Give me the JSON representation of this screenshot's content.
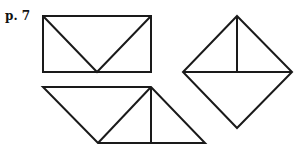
{
  "page_label": "p. 7",
  "stroke_color": "#1a1a1a",
  "figures": [
    {
      "name": "rectangle-with-v",
      "description": "Rectangle with two diagonals meeting at bottom midpoint"
    },
    {
      "name": "diamond-with-cross",
      "description": "Square rotated 45° with horizontal diagonal and vertical half-line from top"
    },
    {
      "name": "parallelogram-triangles",
      "description": "Parallelogram divided into triangles by a diagonal and a vertical line"
    }
  ]
}
